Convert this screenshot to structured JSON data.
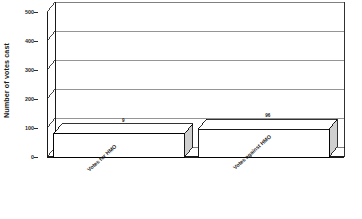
{
  "chart_data": {
    "type": "bar",
    "title": "",
    "subtitle": "",
    "xlabel": "",
    "ylabel": "Number of votes cast",
    "categories": [
      "Votes for HMO",
      "Votes against HMO"
    ],
    "values": [
      80,
      96
    ],
    "value_labels": [
      "9",
      "96"
    ],
    "ylim": [
      0,
      500
    ],
    "yticks": [
      0,
      100,
      200,
      300,
      400,
      500
    ],
    "ytick_labels": [
      "0",
      "100",
      "200",
      "300",
      "400",
      "500"
    ],
    "grid": true,
    "grid_axis": "y",
    "legend": false,
    "legend_position": "none",
    "style": "3d-bar",
    "series": [
      {
        "name": "Votes",
        "values": [
          80,
          96
        ]
      }
    ],
    "colors": {
      "bar_front": "#ffffff",
      "bar_top": "#ffffff",
      "bar_side": "#cfcfcf",
      "bar_shadow": "#3a3a3a",
      "outline": "#000000",
      "grid_line": "#8a8a8a",
      "axis_line": "#1a1a1a",
      "floor": "#ffffff",
      "text": "#1a1a1a",
      "background": "#ffffff"
    }
  },
  "axis": {
    "y_title": "Number of votes cast"
  }
}
